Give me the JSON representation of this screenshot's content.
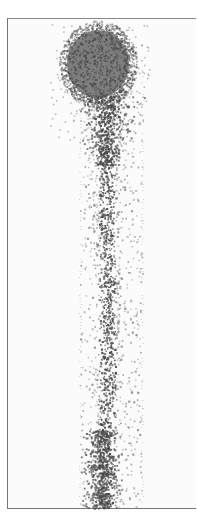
{
  "image": {
    "description": "Grayscale scanned image of a dense dark circular particle cluster at top with a dotted stream trailing downward",
    "width": 197,
    "height": 515,
    "frame": {
      "left": 7,
      "top": 18,
      "right": 196,
      "bottom": 509,
      "border_color": "#777777",
      "background": "#fbfbfb"
    },
    "blob": {
      "cx": 98,
      "cy": 64,
      "rx": 34,
      "ry": 38,
      "color": "#6a6a6a"
    },
    "stream": {
      "x_min": 80,
      "x_max": 142,
      "core_x": 107,
      "y_start": 100,
      "y_end": 508,
      "dot_color": "#555555"
    },
    "colors": {
      "dark": "#4a4a4a",
      "mid": "#7a7a7a",
      "light": "#b0b0b0"
    }
  }
}
